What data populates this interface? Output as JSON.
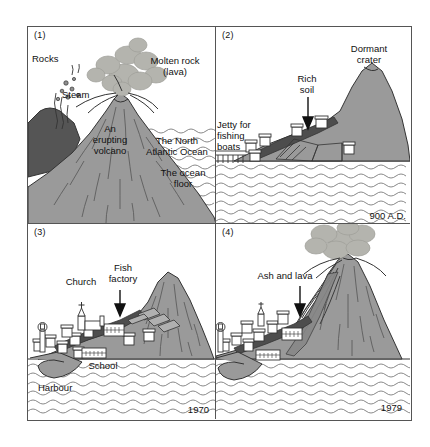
{
  "figure": {
    "panels": [
      {
        "number": "(1)",
        "caption_labels": [
          {
            "name": "rocks",
            "text": "Rocks"
          },
          {
            "name": "steam",
            "text": "Steam"
          },
          {
            "name": "molten-rock",
            "text": "Molten rock\n(lava)"
          },
          {
            "name": "erupting-volcano",
            "text": "An\nerupting\nvolcano"
          },
          {
            "name": "north-atlantic-ocean",
            "text": "The North\nAtlantic Ocean"
          },
          {
            "name": "ocean-floor",
            "text": "The ocean\nfloor"
          }
        ],
        "year": ""
      },
      {
        "number": "(2)",
        "caption_labels": [
          {
            "name": "dormant-crater",
            "text": "Dormant\ncrater"
          },
          {
            "name": "rich-soil",
            "text": "Rich\nsoil"
          },
          {
            "name": "jetty-for-fishing-boats",
            "text": "Jetty for\nfishing\nboats"
          }
        ],
        "year": "900 A.D."
      },
      {
        "number": "(3)",
        "caption_labels": [
          {
            "name": "church",
            "text": "Church"
          },
          {
            "name": "fish-factory",
            "text": "Fish\nfactory"
          },
          {
            "name": "school",
            "text": "School"
          },
          {
            "name": "harbour",
            "text": "Harbour"
          }
        ],
        "year": "1970"
      },
      {
        "number": "(4)",
        "caption_labels": [
          {
            "name": "ash-and-lava",
            "text": "Ash and lava"
          }
        ],
        "year": "1979"
      }
    ],
    "colors": {
      "ink": "#333333",
      "frame": "#555555",
      "land_gray": "#9a9a9a",
      "dark_rock": "#555555",
      "smoke_gray": "#b4b4ae",
      "soil_dark": "#4d4d4d",
      "building_fill": "#ffffff",
      "water_line": "#6b6b6b",
      "paper": "#ffffff"
    }
  }
}
